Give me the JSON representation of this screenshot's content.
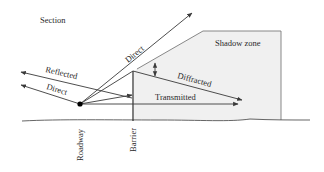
{
  "diagram": {
    "title": "Section",
    "labels": {
      "shadow_zone": "Shadow zone",
      "direct_up": "Direct",
      "direct_left": "Direct",
      "reflected": "Reflected",
      "diffracted": "Diffracted",
      "transmitted": "Transmitted",
      "roadway": "Roadway",
      "barrier": "Barrier"
    },
    "colors": {
      "line": "#3a3a3a",
      "shadow_fill": "#f0f0f0",
      "shadow_edge": "#7a7a7a",
      "source": "#000000"
    }
  }
}
